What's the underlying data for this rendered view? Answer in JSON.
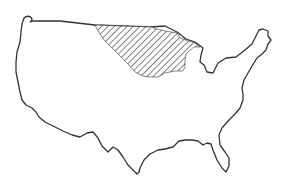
{
  "map": {
    "subject": "Contiguous United States outline",
    "highlighted_region": {
      "description": "Hatched upper Midwest / northern plains region",
      "pattern": "diagonal-hatch",
      "pattern_color": "#333333"
    },
    "outline_color": "#333333",
    "background_color": "#ffffff"
  }
}
